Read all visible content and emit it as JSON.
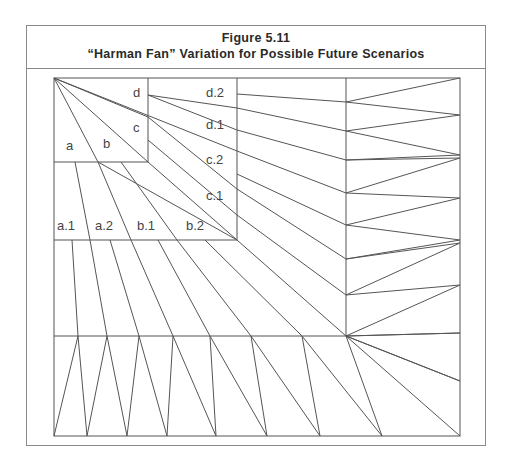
{
  "figure": {
    "number": "Figure 5.11",
    "title": "“Harman Fan” Variation for Possible Future Scenarios"
  },
  "diagram": {
    "line_color": "#555555",
    "top_level_labels": [
      "a",
      "b",
      "c",
      "d"
    ],
    "second_level_labels": [
      "a.1",
      "a.2",
      "b.1",
      "b.2",
      "c.1",
      "c.2",
      "d.1",
      "d.2"
    ],
    "labels": {
      "a": "a",
      "b": "b",
      "c": "c",
      "d": "d",
      "a1": "a.1",
      "a2": "a.2",
      "b1": "b.1",
      "b2": "b.2",
      "c1": "c.1",
      "c2": "c.2",
      "d1": "d.1",
      "d2": "d.2"
    }
  }
}
